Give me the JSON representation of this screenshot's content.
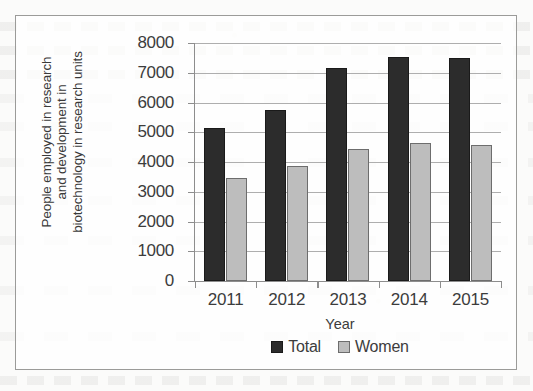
{
  "chart_data": {
    "type": "bar",
    "title": "",
    "xlabel": "Year",
    "ylabel": "People employed in research and development in biotechnology in research units",
    "ylabel_lines": [
      "People employed in research",
      "and development in",
      "biotechnology in research units"
    ],
    "categories": [
      "2011",
      "2012",
      "2013",
      "2014",
      "2015"
    ],
    "series": [
      {
        "name": "Total",
        "color": "#2c2c2c",
        "values": [
          5150,
          5750,
          7150,
          7520,
          7480
        ]
      },
      {
        "name": "Women",
        "color": "#bdbdbd",
        "values": [
          3450,
          3850,
          4450,
          4650,
          4570
        ]
      }
    ],
    "ylim": [
      0,
      8000
    ],
    "ytick_values": [
      0,
      1000,
      2000,
      3000,
      4000,
      5000,
      6000,
      7000,
      8000
    ],
    "ytick_labels": [
      "0",
      "1000",
      "2000",
      "3000",
      "4000",
      "5000",
      "6000",
      "7000",
      "8000"
    ],
    "grid": true,
    "grid_axis": "y",
    "legend_position": "bottom",
    "legend": [
      "Total",
      "Women"
    ]
  },
  "figure": {
    "border_color": "#9b9b99",
    "background": "#ffffff",
    "axis_color": "#8d8d8d",
    "gridline_color": "#aeaeae",
    "text_color": "#3c3c3c"
  }
}
